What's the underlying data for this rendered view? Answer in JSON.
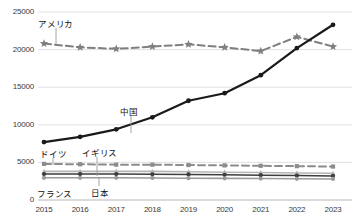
{
  "chart_data": {
    "type": "line",
    "title": "",
    "xlabel": "",
    "ylabel": "",
    "categories": [
      "2015",
      "2016",
      "2017",
      "2018",
      "2019",
      "2020",
      "2021",
      "2022",
      "2023"
    ],
    "ylim": [
      0,
      25000
    ],
    "ytick_labels": [
      "0",
      "5000",
      "10000",
      "15000",
      "20000",
      "25000"
    ],
    "yticks": [
      0,
      5000,
      10000,
      15000,
      20000,
      25000
    ],
    "grid": true,
    "legend_position": "inline-labels",
    "series": [
      {
        "name": "アメリカ",
        "name_en": "United States",
        "color": "#7f7f7f",
        "style": "dashed",
        "marker": "star",
        "values": [
          20800,
          20300,
          20100,
          20400,
          20700,
          20300,
          19800,
          21700,
          20400
        ]
      },
      {
        "name": "中国",
        "name_en": "China",
        "color": "#1a1a1a",
        "style": "solid",
        "marker": "circle",
        "values": [
          7700,
          8400,
          9400,
          11000,
          13200,
          14200,
          16600,
          20200,
          23300
        ]
      },
      {
        "name": "ドイツ",
        "name_en": "Germany",
        "color": "#8c8c8c",
        "style": "dashed",
        "marker": "square",
        "values": [
          4800,
          4750,
          4700,
          4700,
          4650,
          4600,
          4550,
          4500,
          4450
        ]
      },
      {
        "name": "イギリス",
        "name_en": "United Kingdom",
        "color": "#b5b5b5",
        "style": "solid",
        "marker": "triangle",
        "values": [
          3800,
          3800,
          3800,
          3800,
          3750,
          3700,
          3650,
          3600,
          3550
        ]
      },
      {
        "name": "日本",
        "name_en": "Japan",
        "color": "#3d3d3d",
        "style": "solid",
        "marker": "circle",
        "values": [
          3450,
          3450,
          3450,
          3420,
          3400,
          3350,
          3300,
          3250,
          3200
        ]
      },
      {
        "name": "フランス",
        "name_en": "France",
        "color": "#9a9a9a",
        "style": "solid",
        "marker": "circle",
        "values": [
          2950,
          2950,
          2950,
          2930,
          2900,
          2880,
          2850,
          2820,
          2800
        ]
      }
    ],
    "annotations": [
      {
        "label": "アメリカ",
        "x": 38,
        "y": 17
      },
      {
        "label": "中国",
        "x": 120,
        "y": 105
      },
      {
        "label": "ドイツ",
        "x": 40,
        "y": 147
      },
      {
        "label": "イギリス",
        "x": 82,
        "y": 146
      },
      {
        "label": "日本",
        "x": 91,
        "y": 186
      },
      {
        "label": "フランス",
        "x": 37,
        "y": 187
      }
    ]
  }
}
